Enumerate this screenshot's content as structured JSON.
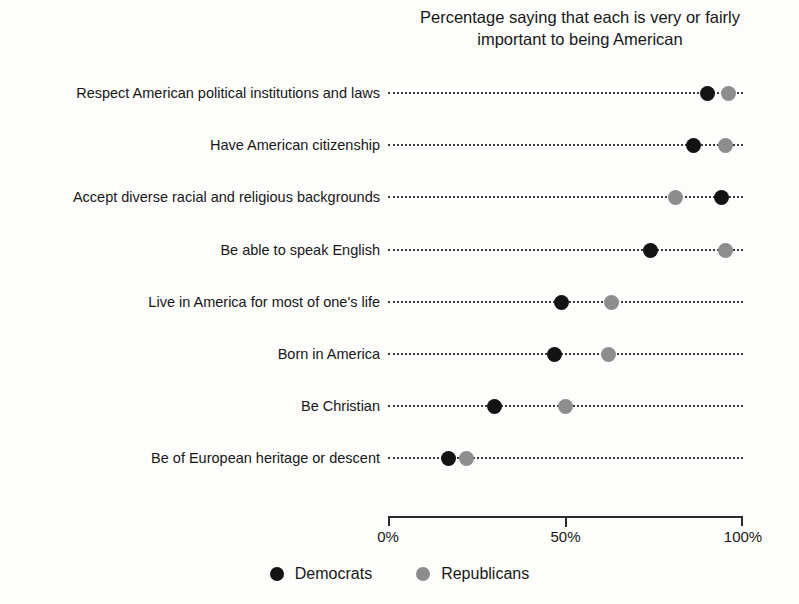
{
  "chart_data": {
    "type": "scatter",
    "title": "Percentage saying that each is very or fairly important to being American",
    "title_lines": [
      "Percentage saying that each is very or fairly",
      "important to being American"
    ],
    "xlabel": "",
    "ylabel": "",
    "xlim": [
      0,
      100
    ],
    "xticks": [
      0,
      50,
      100
    ],
    "xtick_labels": [
      "0%",
      "50%",
      "100%"
    ],
    "grid": "dotted-horizontal-guides",
    "legend_position": "bottom-center",
    "categories": [
      "Respect American political institutions and laws",
      "Have American citizenship",
      "Accept diverse racial and religious backgrounds",
      "Be able to speak English",
      "Live in America for most of one's life",
      "Born in America",
      "Be Christian",
      "Be of European heritage or descent"
    ],
    "series": [
      {
        "name": "Democrats",
        "color": "#131313",
        "values": [
          90,
          86,
          94,
          74,
          49,
          47,
          30,
          17
        ]
      },
      {
        "name": "Republicans",
        "color": "#8d8d8d",
        "values": [
          96,
          95,
          81,
          95,
          63,
          62,
          50,
          22
        ]
      }
    ]
  },
  "legend": {
    "items": [
      {
        "label": "Democrats",
        "color": "#131313"
      },
      {
        "label": "Republicans",
        "color": "#8d8d8d"
      }
    ]
  }
}
